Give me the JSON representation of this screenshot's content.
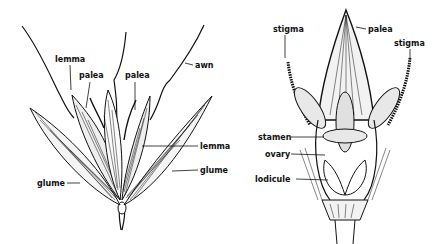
{
  "figure": {
    "left": {
      "title": "grass spikelet",
      "labels": {
        "lemma_top": "lemma",
        "palea_left": "palea",
        "palea_right": "palea",
        "awn": "awn",
        "lemma_right": "lemma",
        "glume_right": "glume",
        "glume_left": "glume"
      }
    },
    "right": {
      "title": "grass floret",
      "labels": {
        "stigma_left": "stigma",
        "palea": "palea",
        "stigma_right": "stigma",
        "stamen": "stamen",
        "ovary": "ovary",
        "lodicule": "lodicule"
      }
    },
    "colors": {
      "ink": "#111111",
      "background": "#ffffff"
    }
  }
}
